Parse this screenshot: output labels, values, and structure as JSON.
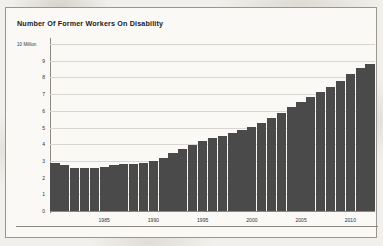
{
  "chart_data": {
    "type": "bar",
    "title": "Number Of Former Workers On Disability",
    "unit_label": "10 Million",
    "xlabel": "",
    "ylabel": "",
    "ylim": [
      0,
      10
    ],
    "grid": true,
    "legend": "none",
    "ytick_labels": [
      "10 Million",
      "9",
      "8",
      "7",
      "6",
      "5",
      "4",
      "3",
      "2",
      "1",
      "0"
    ],
    "ytick_values": [
      10,
      9,
      8,
      7,
      6,
      5,
      4,
      3,
      2,
      1,
      0
    ],
    "xtick_labels": [
      "1985",
      "1990",
      "1995",
      "2000",
      "2005",
      "2010"
    ],
    "xtick_values": [
      1985,
      1990,
      1995,
      2000,
      2005,
      2010
    ],
    "categories": [
      1980,
      1981,
      1982,
      1983,
      1984,
      1985,
      1986,
      1987,
      1988,
      1989,
      1990,
      1991,
      1992,
      1993,
      1994,
      1995,
      1996,
      1997,
      1998,
      1999,
      2000,
      2001,
      2002,
      2003,
      2004,
      2005,
      2006,
      2007,
      2008,
      2009,
      2010,
      2011,
      2012
    ],
    "values": [
      2.86,
      2.78,
      2.6,
      2.57,
      2.58,
      2.66,
      2.73,
      2.79,
      2.83,
      2.9,
      3.01,
      3.19,
      3.47,
      3.73,
      3.96,
      4.18,
      4.38,
      4.51,
      4.7,
      4.88,
      5.04,
      5.27,
      5.54,
      5.87,
      6.2,
      6.52,
      6.81,
      7.1,
      7.43,
      7.79,
      8.2,
      8.58,
      8.83
    ],
    "bar_color": "#4a4a4a",
    "grid_color": "#d9d6d0",
    "axis_color": "#8c8880",
    "background_color": "#faf9f6",
    "text_color": "#1b1b1b"
  }
}
